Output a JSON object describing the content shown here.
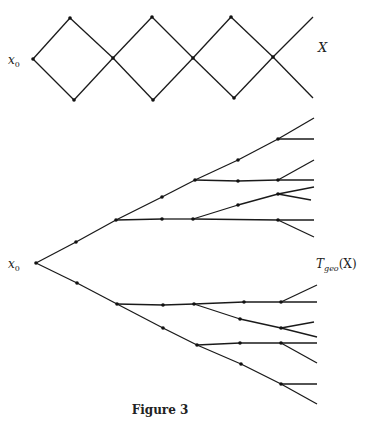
{
  "figure": {
    "caption": "Figure 3",
    "top_diagram": {
      "start_label": "x",
      "start_subscript": "0",
      "end_label": "X",
      "edges": [
        [
          33,
          59,
          70,
          18
        ],
        [
          33,
          59,
          74,
          100
        ],
        [
          70,
          18,
          113,
          58
        ],
        [
          74,
          100,
          113,
          58
        ],
        [
          113,
          58,
          152,
          17
        ],
        [
          113,
          58,
          153,
          100
        ],
        [
          152,
          17,
          193,
          58
        ],
        [
          153,
          100,
          193,
          58
        ],
        [
          193,
          58,
          231,
          17
        ],
        [
          193,
          58,
          234,
          98
        ],
        [
          231,
          17,
          273,
          57
        ],
        [
          234,
          98,
          273,
          57
        ],
        [
          273,
          57,
          313,
          17
        ],
        [
          273,
          57,
          313,
          98
        ]
      ],
      "nodes": [
        [
          33,
          59
        ],
        [
          70,
          18
        ],
        [
          74,
          100
        ],
        [
          113,
          58
        ],
        [
          152,
          17
        ],
        [
          153,
          100
        ],
        [
          193,
          58
        ],
        [
          231,
          17
        ],
        [
          234,
          98
        ],
        [
          273,
          57
        ]
      ]
    },
    "tree_diagram": {
      "root_label": "x",
      "root_subscript": "0",
      "tree_label": "T",
      "tree_subscript": "geo",
      "tree_label_suffix": "(X)",
      "edges": [
        [
          36,
          263,
          76,
          242
        ],
        [
          76,
          242,
          116,
          220
        ],
        [
          116,
          220,
          162,
          197
        ],
        [
          162,
          197,
          195,
          180
        ],
        [
          195,
          180,
          238,
          160
        ],
        [
          238,
          160,
          278,
          139
        ],
        [
          278,
          139,
          314,
          118
        ],
        [
          278,
          139,
          314,
          139
        ],
        [
          195,
          180,
          238,
          181
        ],
        [
          238,
          181,
          278,
          180
        ],
        [
          278,
          180,
          314,
          180
        ],
        [
          278,
          180,
          314,
          160
        ],
        [
          116,
          220,
          162,
          219
        ],
        [
          162,
          219,
          193,
          219
        ],
        [
          193,
          219,
          278,
          220
        ],
        [
          278,
          220,
          314,
          220
        ],
        [
          278,
          220,
          314,
          237
        ],
        [
          193,
          219,
          238,
          205
        ],
        [
          238,
          205,
          278,
          194
        ],
        [
          278,
          194,
          314,
          187
        ],
        [
          278,
          194,
          311,
          200
        ],
        [
          36,
          263,
          77,
          283
        ],
        [
          77,
          283,
          117,
          304
        ],
        [
          117,
          304,
          163,
          328
        ],
        [
          163,
          328,
          197,
          345
        ],
        [
          197,
          345,
          241,
          364
        ],
        [
          241,
          364,
          281,
          384
        ],
        [
          281,
          384,
          317,
          404
        ],
        [
          281,
          384,
          317,
          384
        ],
        [
          117,
          304,
          163,
          305
        ],
        [
          163,
          305,
          194,
          304
        ],
        [
          194,
          304,
          244,
          302
        ],
        [
          244,
          302,
          281,
          302
        ],
        [
          281,
          302,
          317,
          302
        ],
        [
          281,
          302,
          317,
          285
        ],
        [
          194,
          304,
          240,
          319
        ],
        [
          240,
          319,
          281,
          328
        ],
        [
          281,
          328,
          317,
          337
        ],
        [
          281,
          328,
          314,
          322
        ],
        [
          197,
          345,
          240,
          343
        ],
        [
          240,
          343,
          281,
          343
        ],
        [
          281,
          343,
          317,
          343
        ],
        [
          281,
          343,
          317,
          363
        ]
      ],
      "nodes": [
        [
          36,
          263
        ],
        [
          76,
          242
        ],
        [
          116,
          220
        ],
        [
          162,
          197
        ],
        [
          195,
          180
        ],
        [
          238,
          160
        ],
        [
          278,
          139
        ],
        [
          238,
          181
        ],
        [
          278,
          180
        ],
        [
          162,
          219
        ],
        [
          193,
          219
        ],
        [
          278,
          220
        ],
        [
          238,
          205
        ],
        [
          278,
          194
        ],
        [
          77,
          283
        ],
        [
          117,
          304
        ],
        [
          163,
          328
        ],
        [
          197,
          345
        ],
        [
          241,
          364
        ],
        [
          281,
          384
        ],
        [
          163,
          305
        ],
        [
          194,
          304
        ],
        [
          244,
          302
        ],
        [
          281,
          302
        ],
        [
          240,
          319
        ],
        [
          281,
          328
        ],
        [
          240,
          343
        ],
        [
          281,
          343
        ]
      ]
    }
  }
}
